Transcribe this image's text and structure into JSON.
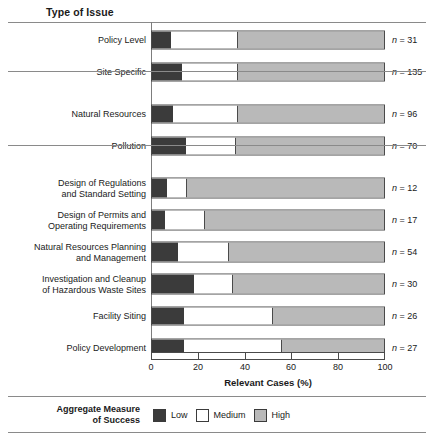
{
  "header": {
    "column_title": "Type of Issue"
  },
  "chart_data": {
    "type": "bar",
    "subtype": "stacked-horizontal-100",
    "title": "Type of Issue",
    "xlabel": "Relevant Cases (%)",
    "ylabel": "Type of Issue",
    "xlim": [
      0,
      100
    ],
    "xticks": [
      0,
      20,
      40,
      60,
      80,
      100
    ],
    "xticklabels": [
      "0",
      "20",
      "40",
      "60",
      "80",
      "100"
    ],
    "grid": false,
    "legend_position": "bottom",
    "legend_title": "Aggregate Measure of Success",
    "series": [
      {
        "name": "Low",
        "color": "#3b3b3b",
        "values": [
          8,
          13,
          9,
          14.5,
          6.5,
          5.6,
          11,
          18,
          14,
          14
        ]
      },
      {
        "name": "Medium",
        "color": "#ffffff",
        "values": [
          29,
          24,
          28,
          21.5,
          8.5,
          17.4,
          22,
          17,
          38,
          42
        ]
      },
      {
        "name": "High",
        "color": "#b9b9b9",
        "values": [
          63,
          63,
          63,
          64,
          85,
          77,
          67,
          65,
          48,
          44
        ]
      }
    ],
    "categories": [
      "Policy Level",
      "Site Specific",
      "Natural Resources",
      "Pollution",
      "Design of Regulations and Standard Setting",
      "Design of Permits and Operating Requirements",
      "Natural Resources Planning and Management",
      "Investigation and Cleanup of Hazardous Waste Sites",
      "Facility Siting",
      "Policy Development"
    ],
    "counts": [
      31,
      135,
      96,
      70,
      12,
      17,
      54,
      30,
      26,
      27
    ],
    "group_breaks_after": [
      1,
      3
    ]
  },
  "rows": [
    {
      "label_line1": "Policy Level",
      "label_line2": "",
      "n": "n = 31",
      "low": 8,
      "med": 29,
      "high": 63
    },
    {
      "label_line1": "Site Specific",
      "label_line2": "",
      "n": "n = 135",
      "low": 13,
      "med": 24,
      "high": 63
    },
    {
      "label_line1": "Natural Resources",
      "label_line2": "",
      "n": "n = 96",
      "low": 9,
      "med": 28,
      "high": 63
    },
    {
      "label_line1": "Pollution",
      "label_line2": "",
      "n": "n = 70",
      "low": 14.5,
      "med": 21.5,
      "high": 64
    },
    {
      "label_line1": "Design of Regulations",
      "label_line2": "and Standard Setting",
      "n": "n = 12",
      "low": 6.5,
      "med": 8.5,
      "high": 85
    },
    {
      "label_line1": "Design of Permits and",
      "label_line2": "Operating Requirements",
      "n": "n = 17",
      "low": 5.6,
      "med": 17.4,
      "high": 77
    },
    {
      "label_line1": "Natural Resources Planning",
      "label_line2": "and Management",
      "n": "n = 54",
      "low": 11,
      "med": 22,
      "high": 67
    },
    {
      "label_line1": "Investigation and Cleanup",
      "label_line2": "of Hazardous Waste Sites",
      "n": "n = 30",
      "low": 18,
      "med": 17,
      "high": 65
    },
    {
      "label_line1": "Facility Siting",
      "label_line2": "",
      "n": "n = 26",
      "low": 14,
      "med": 38,
      "high": 48
    },
    {
      "label_line1": "Policy Development",
      "label_line2": "",
      "n": "n = 27",
      "low": 14,
      "med": 42,
      "high": 44
    }
  ],
  "xaxis": {
    "title": "Relevant Cases (%)",
    "ticks": [
      "0",
      "20",
      "40",
      "60",
      "80",
      "100"
    ]
  },
  "legend": {
    "title_line1": "Aggregate Measure",
    "title_line2": "of Success",
    "items": [
      {
        "label": "Low",
        "color": "#3b3b3b"
      },
      {
        "label": "Medium",
        "color": "#ffffff"
      },
      {
        "label": "High",
        "color": "#b9b9b9"
      }
    ]
  },
  "colors": {
    "low": "#3b3b3b",
    "medium": "#ffffff",
    "high": "#b9b9b9",
    "outline": "#4a4a4a",
    "rule": "#8a8a8a"
  }
}
